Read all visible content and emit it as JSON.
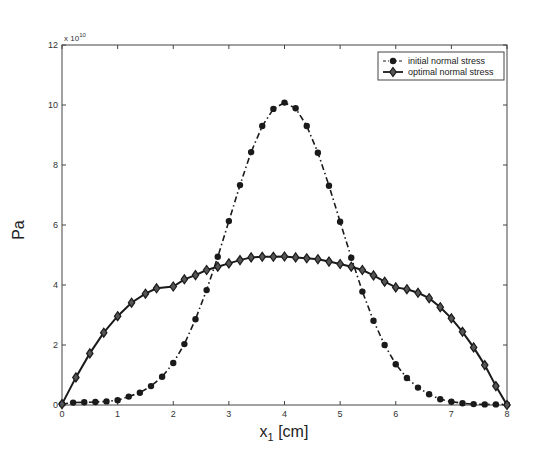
{
  "chart_data": {
    "type": "line",
    "title": "",
    "xlabel": "x_1 [cm]",
    "xlabel_main": "x",
    "xlabel_sub": "1",
    "xlabel_unit": "[cm]",
    "ylabel": "Pa",
    "y_multiplier": "x 10",
    "y_multiplier_exp": "10",
    "xlim": [
      0,
      8
    ],
    "ylim": [
      0,
      12
    ],
    "xticks": [
      0,
      1,
      2,
      3,
      4,
      5,
      6,
      7,
      8
    ],
    "yticks": [
      0,
      2,
      4,
      6,
      8,
      10,
      12
    ],
    "grid": false,
    "legend_position": "upper right",
    "series": [
      {
        "name": "initial normal stress",
        "marker": "circle",
        "line_style": "dash-dot",
        "color": "#1a1a1a",
        "x": [
          0,
          0.2,
          0.4,
          0.6,
          0.8,
          1.0,
          1.2,
          1.4,
          1.6,
          1.8,
          2.0,
          2.2,
          2.4,
          2.6,
          2.8,
          3.0,
          3.2,
          3.4,
          3.6,
          3.8,
          4.0,
          4.2,
          4.4,
          4.6,
          4.8,
          5.0,
          5.2,
          5.4,
          5.6,
          5.8,
          6.0,
          6.2,
          6.4,
          6.6,
          6.8,
          7.0,
          7.2,
          7.4,
          7.6,
          7.8,
          8.0
        ],
        "values": [
          0.03,
          0.08,
          0.09,
          0.1,
          0.12,
          0.16,
          0.28,
          0.41,
          0.63,
          0.94,
          1.4,
          2.03,
          2.86,
          3.83,
          4.94,
          6.13,
          7.33,
          8.43,
          9.3,
          9.87,
          10.08,
          9.89,
          9.3,
          8.41,
          7.31,
          6.11,
          4.91,
          3.78,
          2.81,
          2.0,
          1.36,
          0.9,
          0.58,
          0.36,
          0.19,
          0.11,
          0.06,
          0.03,
          0.02,
          0.02,
          0.02
        ]
      },
      {
        "name": "optimal normal stress",
        "marker": "diamond",
        "line_style": "solid",
        "color": "#1a1a1a",
        "x": [
          0,
          0.25,
          0.5,
          0.75,
          1.0,
          1.25,
          1.5,
          1.7,
          2.0,
          2.2,
          2.4,
          2.6,
          2.8,
          3.0,
          3.2,
          3.4,
          3.6,
          3.8,
          4.0,
          4.2,
          4.4,
          4.6,
          4.8,
          5.0,
          5.2,
          5.4,
          5.6,
          5.8,
          6.0,
          6.2,
          6.4,
          6.6,
          6.8,
          7.0,
          7.2,
          7.4,
          7.6,
          7.8,
          8.0
        ],
        "values": [
          0.03,
          0.92,
          1.72,
          2.41,
          2.96,
          3.41,
          3.71,
          3.89,
          3.95,
          4.19,
          4.33,
          4.5,
          4.61,
          4.72,
          4.83,
          4.92,
          4.94,
          4.94,
          4.95,
          4.92,
          4.89,
          4.86,
          4.78,
          4.7,
          4.61,
          4.5,
          4.32,
          4.11,
          3.92,
          3.86,
          3.74,
          3.56,
          3.26,
          2.89,
          2.44,
          1.92,
          1.33,
          0.63,
          0.0
        ]
      }
    ]
  }
}
